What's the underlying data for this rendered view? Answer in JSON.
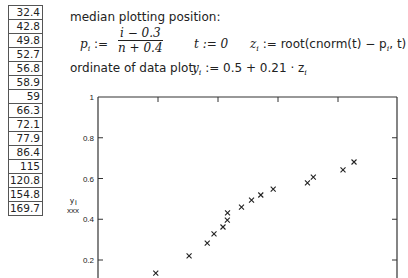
{
  "table": {
    "values": [
      "32.4",
      "42.8",
      "49.8",
      "52.7",
      "56.8",
      "58.9",
      "59",
      "66.3",
      "72.1",
      "77.9",
      "86.4",
      "115",
      "120.8",
      "154.8",
      "169.7"
    ]
  },
  "text": {
    "heading": "median plotting position:",
    "p_lhs": "p",
    "p_sub": "i",
    "assign": ":=",
    "p_num": "i − 0.3",
    "p_den": "n + 0.4",
    "t_def": "t := 0",
    "z_lhs": "z",
    "z_sub": "i",
    "z_rhs": ":= root(cnorm(t) − p",
    "z_rhs_sub": "i",
    "z_rhs_end": ", t)",
    "ordinate_label": "ordinate of data plot:",
    "y_lhs": "y",
    "y_sub": "i",
    "y_rhs": ":= 0.5 + 0.21 · z",
    "y_rhs_sub": "i"
  },
  "chart_data": {
    "type": "scatter",
    "title": "",
    "xlabel": "",
    "ylabel": "y_i",
    "ylabel_marker": "xxx",
    "x_scale": "log",
    "xlim": [
      20,
      243
    ],
    "ylim": [
      0.2,
      1
    ],
    "y_ticks": [
      "1",
      "0.8",
      "0.6",
      "0.4",
      "0.2"
    ],
    "grid": false,
    "marker": "x",
    "x": [
      32.4,
      42.8,
      49.8,
      52.7,
      56.8,
      58.9,
      59,
      66.3,
      72.1,
      77.9,
      86.4,
      115,
      120.8,
      154.8,
      169.7
    ],
    "y": [
      0.136,
      0.22,
      0.283,
      0.328,
      0.362,
      0.396,
      0.431,
      0.46,
      0.494,
      0.519,
      0.548,
      0.578,
      0.607,
      0.642,
      0.681
    ],
    "colors": {
      "axis": "#333333",
      "marker": "#222222"
    }
  }
}
